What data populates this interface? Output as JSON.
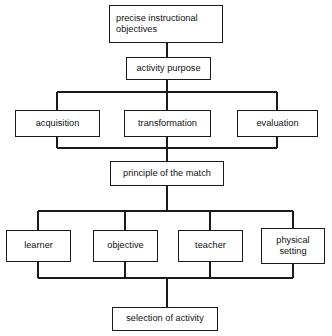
{
  "diagram": {
    "title_text": "",
    "stroke_color": "#1a1a1a",
    "text_color": "#111111",
    "background_color": "#ffffff",
    "nodes": [
      {
        "id": "precise-instructional-objectives",
        "label": "precise instructional\nobjectives"
      },
      {
        "id": "activity-purpose",
        "label": "activity purpose"
      },
      {
        "id": "acquisition",
        "label": "acquisition"
      },
      {
        "id": "transformation",
        "label": "transformation"
      },
      {
        "id": "evaluation",
        "label": "evaluation"
      },
      {
        "id": "principle-of-the-match",
        "label": "principle of the match"
      },
      {
        "id": "learner",
        "label": "learner"
      },
      {
        "id": "objective",
        "label": "objective"
      },
      {
        "id": "teacher",
        "label": "teacher"
      },
      {
        "id": "physical-setting",
        "label": "physical\nsetting"
      },
      {
        "id": "selection-of-activity",
        "label": "selection of activity"
      }
    ]
  }
}
